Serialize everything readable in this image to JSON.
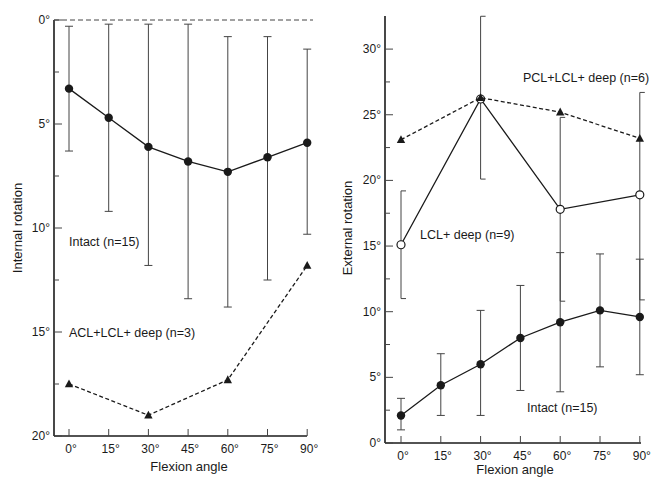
{
  "chart_data": [
    {
      "type": "line",
      "panel": "left",
      "title": "",
      "xlabel": "Flexion angle",
      "ylabel": "Internal rotation",
      "x": [
        0,
        15,
        30,
        45,
        60,
        75,
        90
      ],
      "x_tick_labels": [
        "0°",
        "15°",
        "30°",
        "45°",
        "60°",
        "75°",
        "90°"
      ],
      "y_tick_labels": [
        "0°",
        "5°",
        "10°",
        "15°",
        "20°"
      ],
      "ylim": [
        0,
        20
      ],
      "y_inverted": true,
      "reference_line": {
        "y": 0,
        "style": "dashed"
      },
      "series": [
        {
          "name": "Intact (n=15)",
          "marker": "filled-circle",
          "line": "solid",
          "x": [
            0,
            15,
            30,
            45,
            60,
            75,
            90
          ],
          "values": [
            3.3,
            4.7,
            6.1,
            6.8,
            7.3,
            6.6,
            5.9
          ],
          "error_low": [
            0.3,
            0.2,
            0.2,
            0.2,
            0.8,
            0.8,
            1.4
          ],
          "error_high": [
            6.3,
            9.2,
            11.8,
            13.4,
            13.8,
            12.5,
            10.3
          ]
        },
        {
          "name": "ACL+LCL+ deep (n=3)",
          "marker": "filled-triangle",
          "line": "dashed",
          "x": [
            0,
            30,
            60,
            90
          ],
          "values": [
            17.5,
            19.0,
            17.3,
            11.8
          ]
        }
      ]
    },
    {
      "type": "line",
      "panel": "right",
      "title": "",
      "xlabel": "Flexion angle",
      "ylabel": "External rotation",
      "x": [
        0,
        15,
        30,
        45,
        60,
        75,
        90
      ],
      "x_tick_labels": [
        "0°",
        "15°",
        "30°",
        "45°",
        "60°",
        "75°",
        "90°"
      ],
      "y_tick_labels": [
        "0°",
        "5°",
        "10°",
        "15°",
        "20°",
        "25°",
        "30°"
      ],
      "ylim": [
        0,
        32.5
      ],
      "series": [
        {
          "name": "Intact (n=15)",
          "marker": "filled-circle",
          "line": "solid",
          "x": [
            0,
            15,
            30,
            45,
            60,
            75,
            90
          ],
          "values": [
            2.1,
            4.4,
            6.0,
            8.0,
            9.2,
            10.1,
            9.6
          ],
          "error_low": [
            1.0,
            2.1,
            2.1,
            4.0,
            3.9,
            5.8,
            5.2
          ],
          "error_high": [
            3.4,
            6.8,
            10.1,
            12.0,
            14.5,
            14.4,
            14.0
          ]
        },
        {
          "name": "LCL+ deep (n=9)",
          "marker": "open-circle",
          "line": "solid",
          "x": [
            0,
            30,
            60,
            90
          ],
          "values": [
            15.1,
            26.2,
            17.8,
            18.9
          ],
          "error_low": [
            11.0,
            20.1,
            10.8,
            10.9
          ],
          "error_high": [
            19.2,
            32.5,
            24.8,
            26.7
          ]
        },
        {
          "name": "PCL+LCL+ deep (n=6)",
          "marker": "filled-triangle",
          "line": "dashed",
          "x": [
            0,
            30,
            60,
            90
          ],
          "values": [
            23.1,
            26.3,
            25.2,
            23.2
          ]
        }
      ]
    }
  ],
  "left": {
    "ylabel": "Internal rotation",
    "xlabel": "Flexion angle",
    "annotations": {
      "intact": "Intact (n=15)",
      "acl": "ACL+LCL+ deep (n=3)"
    }
  },
  "right": {
    "ylabel": "External rotation",
    "xlabel": "Flexion angle",
    "annotations": {
      "pcl": "PCL+LCL+ deep (n=6)",
      "lcl": "LCL+ deep (n=9)",
      "intact": "Intact (n=15)"
    }
  }
}
